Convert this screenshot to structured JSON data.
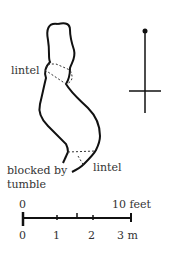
{
  "diagram": {
    "type": "souterrain-plan",
    "labels": {
      "lintel_upper": "lintel",
      "lintel_lower": "lintel",
      "blocked_line1": "blocked by",
      "blocked_line2": "tumble"
    },
    "north_arrow": "north-arrow",
    "scale": {
      "feet": [
        "0",
        "5",
        "10 feet"
      ],
      "meters": [
        "0",
        "1",
        "2",
        "3 m"
      ]
    }
  }
}
